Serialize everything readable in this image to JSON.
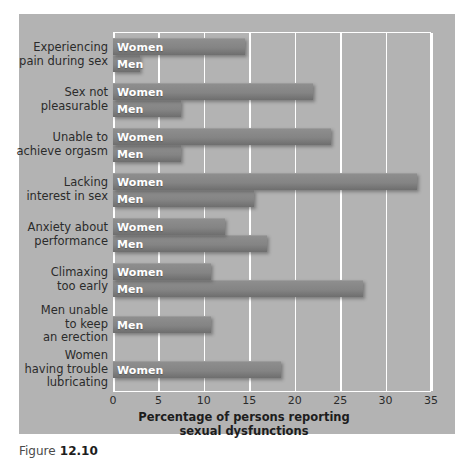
{
  "figure": {
    "caption_prefix": "Figure",
    "caption_number": "12.10",
    "panel_color": "#b3b3b3",
    "bar_color": "#848484",
    "gridline_color": "#ffffff",
    "label_color": "#2b2b2b"
  },
  "chart_data": {
    "type": "bar",
    "orientation": "horizontal",
    "title": "",
    "xlabel_line1": "Percentage of persons reporting",
    "xlabel_line2": "sexual dysfunctions",
    "ylabel": "",
    "xlim": [
      0,
      35
    ],
    "xticks": [
      0,
      5,
      10,
      15,
      20,
      25,
      30,
      35
    ],
    "xticklabels": [
      "0",
      "5",
      "10",
      "15",
      "20",
      "25",
      "30",
      "35"
    ],
    "grid": true,
    "legend": "in-bar",
    "categories": [
      "Experiencing\npain during sex",
      "Sex not\npleasurable",
      "Unable to\nachieve orgasm",
      "Lacking\ninterest in sex",
      "Anxiety about\nperformance",
      "Climaxing\ntoo early",
      "Men unable\nto keep\nan erection",
      "Women\nhaving trouble\nlubricating"
    ],
    "series": [
      {
        "name": "Women",
        "values": [
          14.5,
          22.0,
          24.0,
          33.5,
          12.3,
          10.8,
          null,
          18.5
        ]
      },
      {
        "name": "Men",
        "values": [
          3.0,
          7.5,
          7.5,
          15.5,
          17.0,
          27.5,
          10.8,
          null
        ]
      }
    ],
    "groups": [
      {
        "category": "Experiencing\npain during sex",
        "bars": [
          {
            "series": "Women",
            "label": "Women",
            "value": 14.5
          },
          {
            "series": "Men",
            "label": "Men",
            "value": 3.0
          }
        ]
      },
      {
        "category": "Sex not\npleasurable",
        "bars": [
          {
            "series": "Women",
            "label": "Women",
            "value": 22.0
          },
          {
            "series": "Men",
            "label": "Men",
            "value": 7.5
          }
        ]
      },
      {
        "category": "Unable to\nachieve orgasm",
        "bars": [
          {
            "series": "Women",
            "label": "Women",
            "value": 24.0
          },
          {
            "series": "Men",
            "label": "Men",
            "value": 7.5
          }
        ]
      },
      {
        "category": "Lacking\ninterest in sex",
        "bars": [
          {
            "series": "Women",
            "label": "Women",
            "value": 33.5
          },
          {
            "series": "Men",
            "label": "Men",
            "value": 15.5
          }
        ]
      },
      {
        "category": "Anxiety about\nperformance",
        "bars": [
          {
            "series": "Women",
            "label": "Women",
            "value": 12.3
          },
          {
            "series": "Men",
            "label": "Men",
            "value": 17.0
          }
        ]
      },
      {
        "category": "Climaxing\ntoo early",
        "bars": [
          {
            "series": "Women",
            "label": "Women",
            "value": 10.8
          },
          {
            "series": "Men",
            "label": "Men",
            "value": 27.5
          }
        ]
      },
      {
        "category": "Men unable\nto keep\nan erection",
        "bars": [
          {
            "series": "Men",
            "label": "Men",
            "value": 10.8
          }
        ]
      },
      {
        "category": "Women\nhaving trouble\nlubricating",
        "bars": [
          {
            "series": "Women",
            "label": "Women",
            "value": 18.5
          }
        ]
      }
    ]
  }
}
